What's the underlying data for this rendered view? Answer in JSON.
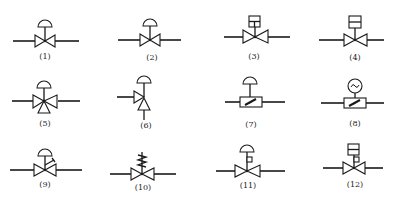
{
  "figure": {
    "symbols": [
      {
        "id": 1,
        "label": "(1)",
        "type": "diaphragm-actuated-valve",
        "cx": 45,
        "cy": 40,
        "lx": 45,
        "ly": 52
      },
      {
        "id": 2,
        "label": "(2)",
        "type": "diaphragm-actuated-valve",
        "cx": 150,
        "cy": 40,
        "lx": 152,
        "ly": 53
      },
      {
        "id": 3,
        "label": "(3)",
        "type": "solenoid-actuated-valve",
        "cx": 254,
        "cy": 37,
        "lx": 254,
        "ly": 52
      },
      {
        "id": 4,
        "label": "(4)",
        "type": "solenoid-actuated-valve",
        "cx": 354,
        "cy": 37,
        "lx": 355,
        "ly": 53
      },
      {
        "id": 5,
        "label": "(5)",
        "type": "diaphragm-three-way-valve",
        "cx": 45,
        "cy": 101,
        "lx": 45,
        "ly": 119
      },
      {
        "id": 6,
        "label": "(6)",
        "type": "diaphragm-angle-valve",
        "cx": 144,
        "cy": 98,
        "lx": 146,
        "ly": 121
      },
      {
        "id": 7,
        "label": "(7)",
        "type": "diaphragm-butterfly-valve",
        "cx": 250,
        "cy": 102,
        "lx": 251,
        "ly": 120
      },
      {
        "id": 8,
        "label": "(8)",
        "type": "motor-butterfly-valve",
        "cx": 355,
        "cy": 102,
        "lx": 355,
        "ly": 119
      },
      {
        "id": 9,
        "label": "(9)",
        "type": "diaphragm-valve-with-handwheel",
        "cx": 45,
        "cy": 170,
        "lx": 45,
        "ly": 180
      },
      {
        "id": 10,
        "label": "(10)",
        "type": "spring-loaded-valve",
        "cx": 142,
        "cy": 174,
        "lx": 143,
        "ly": 183
      },
      {
        "id": 11,
        "label": "(11)",
        "type": "diaphragm-valve-with-positioner",
        "cx": 248,
        "cy": 171,
        "lx": 248,
        "ly": 181
      },
      {
        "id": 12,
        "label": "(12)",
        "type": "solenoid-valve-with-positioner",
        "cx": 353,
        "cy": 168,
        "lx": 355,
        "ly": 180
      }
    ]
  },
  "colors": {
    "line": "#1a1a1a",
    "background": "#ffffff"
  }
}
